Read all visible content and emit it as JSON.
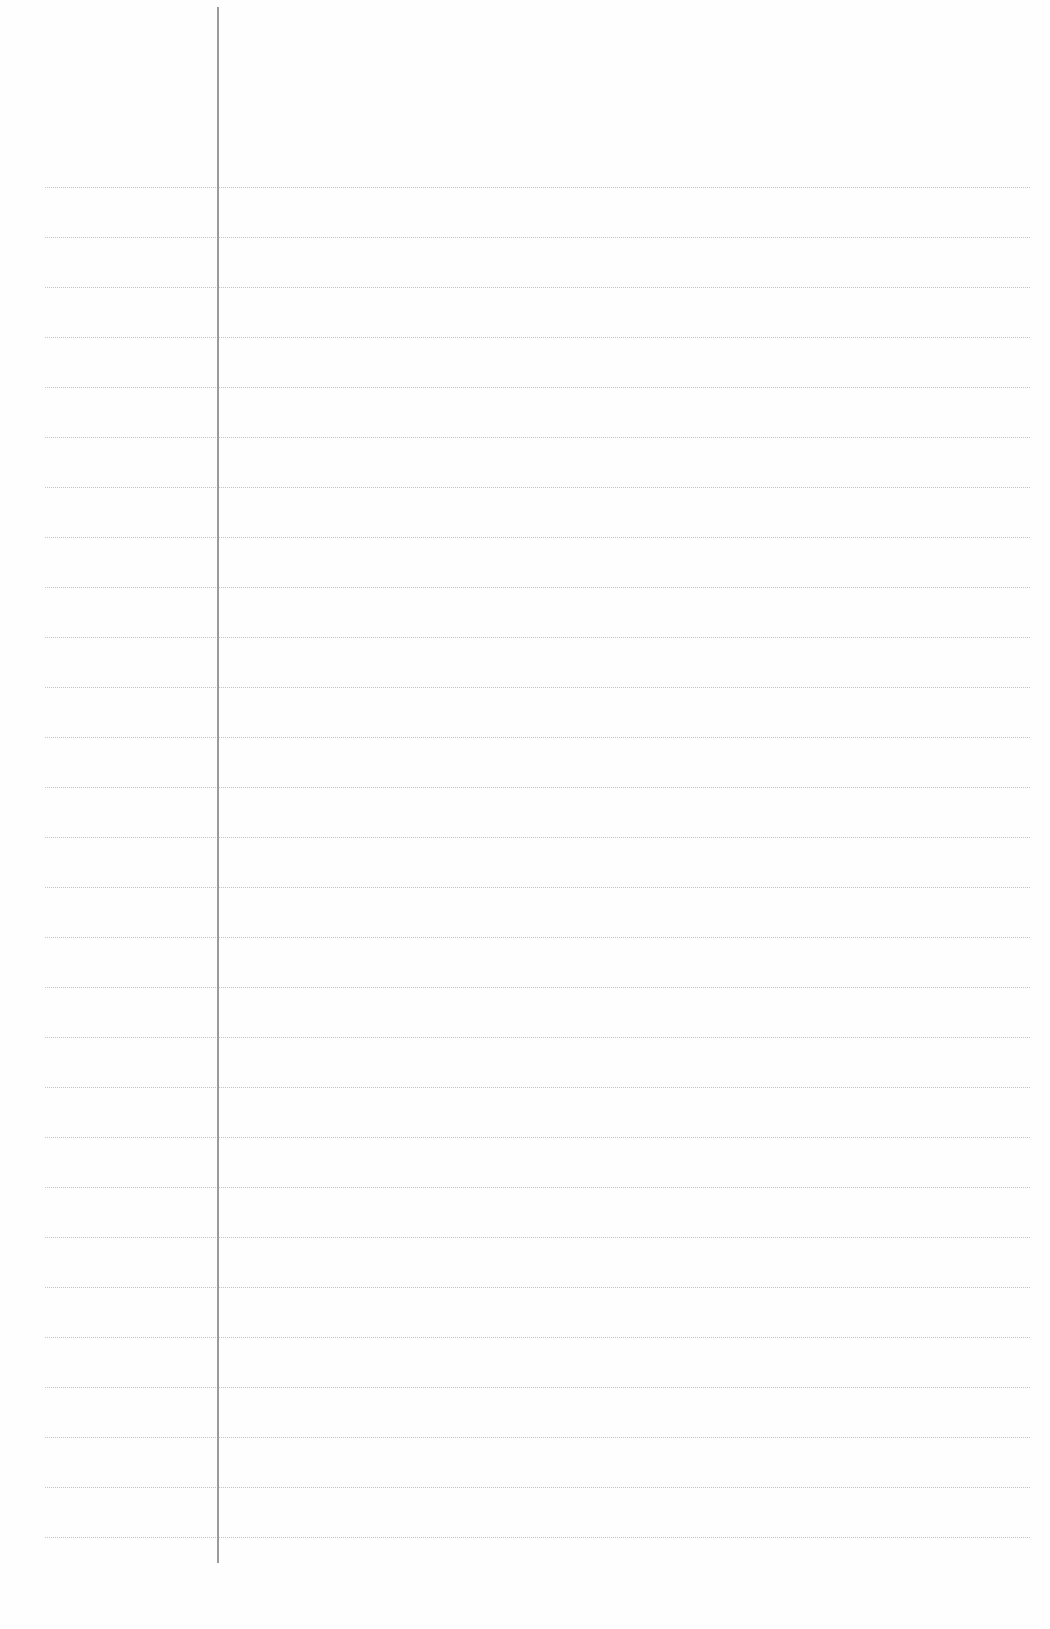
{
  "sheet": {
    "type": "lined-paper",
    "background_color": "#fefefe",
    "rule_color": "#c4c4c4",
    "margin_line_color": "#9a9a9a",
    "rule_count": 28,
    "first_rule_y": 187,
    "rule_spacing": 50,
    "margin_x": 217
  }
}
